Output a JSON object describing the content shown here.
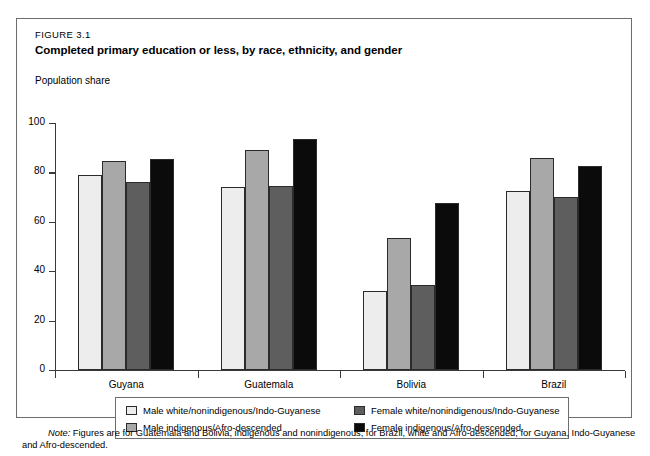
{
  "figure": {
    "number": "FIGURE 3.1",
    "title": "Completed primary education or less, by race, ethnicity, and gender",
    "axis_title": "Population share",
    "note_label": "Note:",
    "note_text": "Figures are for Guatemala and Bolivia, indigenous and nonindigenous; for Brazil, white and Afro-descended; for Guyana, Indo-Guyanese and Afro-descended."
  },
  "colors": {
    "series_0": "#ededed",
    "series_1": "#a8a8a8",
    "series_2": "#5e5e5e",
    "series_3": "#0b0b0b",
    "border": "#6d6d6d",
    "axis": "#3a3a3a"
  },
  "chart_data": {
    "type": "bar",
    "title": "Completed primary education or less, by race, ethnicity, and gender",
    "xlabel": "",
    "ylabel": "Population share",
    "ylim": [
      0,
      100
    ],
    "yticks": [
      0,
      20,
      40,
      60,
      80,
      100
    ],
    "ytick_labels": [
      "0",
      "20",
      "40",
      "60",
      "80",
      "100"
    ],
    "grid": false,
    "legend_position": "below-plot",
    "categories": [
      "Guyana",
      "Guatemala",
      "Bolivia",
      "Brazil"
    ],
    "series": [
      {
        "name": "Male white/nonindigenous/Indo-Guyanese",
        "color": "#ededed",
        "values": [
          79,
          74,
          32,
          72.5
        ]
      },
      {
        "name": "Male indigenous/Afro-descended",
        "color": "#a8a8a8",
        "values": [
          84.5,
          89,
          53.5,
          86
        ]
      },
      {
        "name": "Female white/nonindigenous/Indo-Guyanese",
        "color": "#5e5e5e",
        "values": [
          76,
          74.5,
          34.5,
          70
        ]
      },
      {
        "name": "Female indigenous/Afro-descended",
        "color": "#0b0b0b",
        "values": [
          85.5,
          93.5,
          67.5,
          82.5
        ]
      }
    ]
  }
}
